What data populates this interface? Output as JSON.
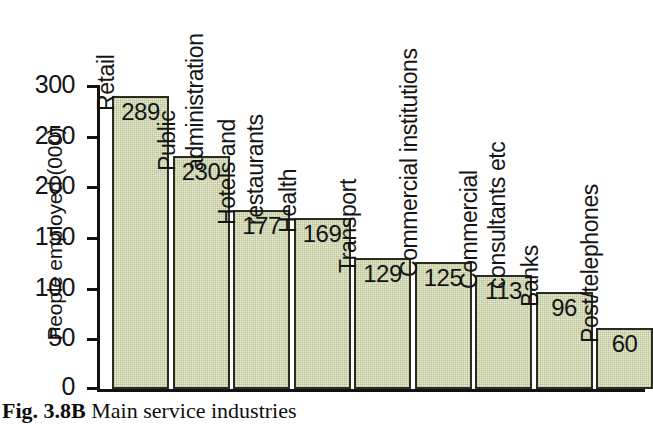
{
  "caption": {
    "figure_number": "Fig. 3.8B",
    "text": "Main service industries"
  },
  "chart_data": {
    "type": "bar",
    "title": "Main service industries",
    "xlabel": "",
    "ylabel": "People employed (000)",
    "ylim": [
      0,
      300
    ],
    "yticks": [
      0,
      50,
      100,
      150,
      200,
      250,
      300
    ],
    "ytick_labels": [
      "0",
      "50",
      "100",
      "150",
      "200",
      "250",
      "300"
    ],
    "grid": false,
    "legend": "none",
    "bar_fill_color": "#e8ecd1",
    "bar_edge_color": "#2b2b24",
    "categories": [
      "Retail",
      "Public administration",
      "Hotels and restaurants",
      "Health",
      "Transport",
      "Commercial institutions",
      "Commercial consultants etc",
      "Banks",
      "Post/telephones"
    ],
    "values": [
      289,
      230,
      177,
      169,
      129,
      125,
      113,
      96,
      60
    ],
    "value_labels": [
      "289",
      "230",
      "177",
      "169",
      "129",
      "125",
      "113",
      "96",
      "60"
    ],
    "category_label_lines": [
      [
        "Retail"
      ],
      [
        "Public",
        "administration"
      ],
      [
        "Hotels and",
        "restaurants"
      ],
      [
        "Health"
      ],
      [
        "Transport"
      ],
      [
        "Commercial institutions"
      ],
      [
        "Commercial",
        "consultants etc"
      ],
      [
        "Banks"
      ],
      [
        "Post/telephones"
      ]
    ]
  }
}
